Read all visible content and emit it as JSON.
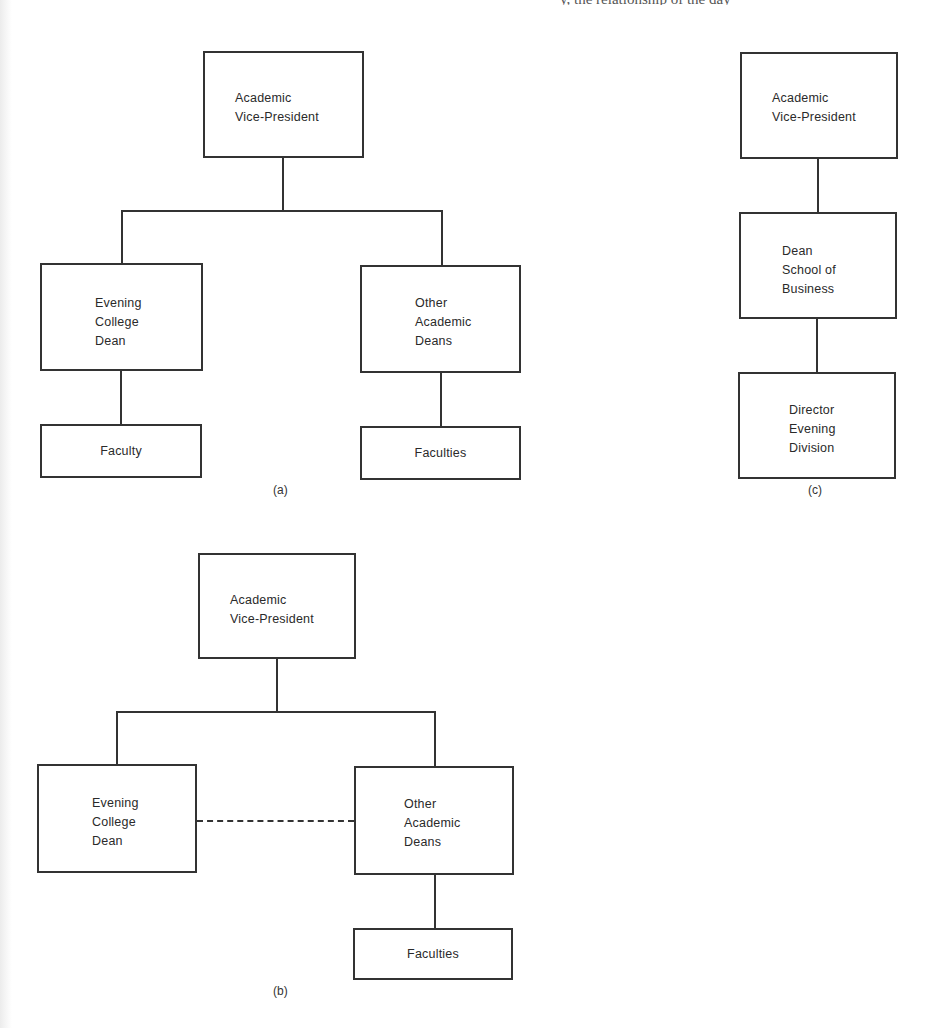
{
  "page": {
    "cropped_header_text": "y, the relationship of the day"
  },
  "diagrams": {
    "a": {
      "caption": "(a)",
      "nodes": {
        "vp": "Academic\nVice-President",
        "evening_dean": "Evening\nCollege\nDean",
        "other_deans": "Other\nAcademic\nDeans",
        "faculty": "Faculty",
        "faculties": "Faculties"
      }
    },
    "b": {
      "caption": "(b)",
      "nodes": {
        "vp": "Academic\nVice-President",
        "evening_dean": "Evening\nCollege\nDean",
        "other_deans": "Other\nAcademic\nDeans",
        "faculties": "Faculties"
      },
      "dashed_link": "evening_dean — other_deans"
    },
    "c": {
      "caption": "(c)",
      "nodes": {
        "vp": "Academic\nVice-President",
        "dean_business": "Dean\nSchool of\nBusiness",
        "director_evening": "Director\nEvening\nDivision"
      }
    }
  },
  "colors": {
    "line": "#333333",
    "background": "#ffffff"
  }
}
